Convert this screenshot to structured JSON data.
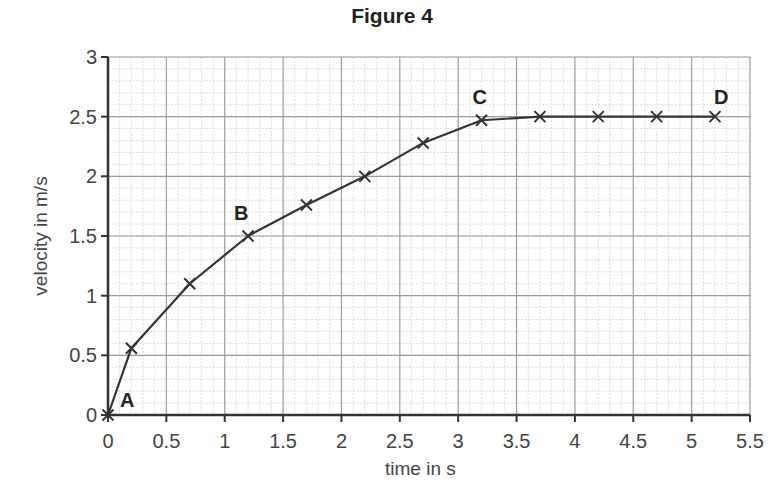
{
  "chart_data": {
    "type": "line",
    "title": "Figure 4",
    "xlabel": "time in s",
    "ylabel": "velocity in m/s",
    "xlim": [
      0,
      5.5
    ],
    "ylim": [
      0,
      3
    ],
    "x_ticks": [
      "0",
      "0.5",
      "1",
      "1.5",
      "2",
      "2.5",
      "3",
      "3.5",
      "4",
      "4.5",
      "5",
      "5.5"
    ],
    "y_ticks": [
      "0",
      "0.5",
      "1",
      "1.5",
      "2",
      "2.5",
      "3"
    ],
    "grid": {
      "major_step_x": 0.5,
      "major_step_y": 0.5,
      "minor_step_x": 0.1,
      "minor_step_y": 0.1
    },
    "marker": "x",
    "series": [
      {
        "name": "velocity",
        "x": [
          0,
          0.2,
          0.7,
          1.2,
          1.7,
          2.2,
          2.7,
          3.2,
          3.7,
          4.2,
          4.7,
          5.2
        ],
        "y": [
          0,
          0.56,
          1.1,
          1.5,
          1.76,
          2.0,
          2.28,
          2.47,
          2.5,
          2.5,
          2.5,
          2.5
        ]
      }
    ],
    "annotations": [
      {
        "text": "A",
        "x": 0,
        "y": 0
      },
      {
        "text": "B",
        "x": 1.2,
        "y": 1.5
      },
      {
        "text": "C",
        "x": 3.2,
        "y": 2.47
      },
      {
        "text": "D",
        "x": 5.2,
        "y": 2.5
      }
    ]
  }
}
